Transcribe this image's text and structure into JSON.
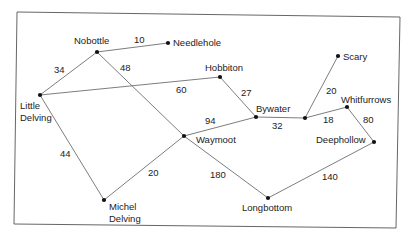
{
  "diagram": {
    "type": "weighted-graph",
    "nodes": [
      {
        "id": "nobottle",
        "label": "Nobottle",
        "x": 97,
        "y": 52,
        "lx": 74,
        "ly": 44,
        "lines": [
          "Nobottle"
        ]
      },
      {
        "id": "needlehole",
        "label": "Needlehole",
        "x": 168,
        "y": 43,
        "lx": 173,
        "ly": 46,
        "lines": [
          "Needlehole"
        ]
      },
      {
        "id": "little-delving",
        "label": "Little Delving",
        "x": 40,
        "y": 95,
        "lx": 20,
        "ly": 109,
        "lines": [
          "Little",
          "Delving"
        ]
      },
      {
        "id": "hobbiton",
        "label": "Hobbiton",
        "x": 220,
        "y": 77,
        "lx": 205,
        "ly": 71,
        "lines": [
          "Hobbiton"
        ]
      },
      {
        "id": "bywater",
        "label": "Bywater",
        "x": 256,
        "y": 117,
        "lx": 256,
        "ly": 112,
        "lines": [
          "Bywater"
        ]
      },
      {
        "id": "junction",
        "label": "",
        "x": 305,
        "y": 118,
        "lx": 0,
        "ly": 0,
        "lines": []
      },
      {
        "id": "scary",
        "label": "Scary",
        "x": 338,
        "y": 56,
        "lx": 343,
        "ly": 60,
        "lines": [
          "Scary"
        ]
      },
      {
        "id": "whitfurrows",
        "label": "Whitfurrows",
        "x": 347,
        "y": 107,
        "lx": 341,
        "ly": 103,
        "lines": [
          "Whitfurrows"
        ]
      },
      {
        "id": "deephollow",
        "label": "Deephollow",
        "x": 374,
        "y": 142,
        "lx": 316,
        "ly": 143,
        "lines": [
          "Deephollow"
        ]
      },
      {
        "id": "waymoot",
        "label": "Waymoot",
        "x": 184,
        "y": 136,
        "lx": 196,
        "ly": 143,
        "lines": [
          "Waymoot"
        ]
      },
      {
        "id": "michel-delving",
        "label": "Michel Delving",
        "x": 104,
        "y": 200,
        "lx": 109,
        "ly": 210,
        "lines": [
          "Michel",
          "Delving"
        ]
      },
      {
        "id": "longbottom",
        "label": "Longbottom",
        "x": 268,
        "y": 198,
        "lx": 242,
        "ly": 211,
        "lines": [
          "Longbottom"
        ]
      }
    ],
    "edges": [
      {
        "from": "nobottle",
        "to": "needlehole",
        "weight": "10",
        "wx": 134,
        "wy": 43
      },
      {
        "from": "nobottle",
        "to": "little-delving",
        "weight": "34",
        "wx": 54,
        "wy": 73
      },
      {
        "from": "nobottle",
        "to": "waymoot",
        "weight": "48",
        "wx": 120,
        "wy": 71
      },
      {
        "from": "little-delving",
        "to": "hobbiton",
        "weight": "60",
        "wx": 176,
        "wy": 93
      },
      {
        "from": "little-delving",
        "to": "michel-delving",
        "weight": "44",
        "wx": 60,
        "wy": 157
      },
      {
        "from": "hobbiton",
        "to": "bywater",
        "weight": "27",
        "wx": 241,
        "wy": 96
      },
      {
        "from": "waymoot",
        "to": "bywater",
        "weight": "94",
        "wx": 205,
        "wy": 124
      },
      {
        "from": "bywater",
        "to": "junction",
        "weight": "32",
        "wx": 272,
        "wy": 129
      },
      {
        "from": "junction",
        "to": "scary",
        "weight": "20",
        "wx": 326,
        "wy": 94
      },
      {
        "from": "junction",
        "to": "whitfurrows",
        "weight": "18",
        "wx": 323,
        "wy": 123
      },
      {
        "from": "whitfurrows",
        "to": "deephollow",
        "weight": "80",
        "wx": 363,
        "wy": 123
      },
      {
        "from": "waymoot",
        "to": "michel-delving",
        "weight": "20",
        "wx": 148,
        "wy": 176
      },
      {
        "from": "waymoot",
        "to": "longbottom",
        "weight": "180",
        "wx": 210,
        "wy": 178
      },
      {
        "from": "longbottom",
        "to": "deephollow",
        "weight": "140",
        "wx": 322,
        "wy": 180
      }
    ]
  },
  "colors": {
    "line": "#6e6e6e",
    "node": "#111111",
    "text": "#222222",
    "frame": "#555555",
    "background": "#ffffff"
  }
}
